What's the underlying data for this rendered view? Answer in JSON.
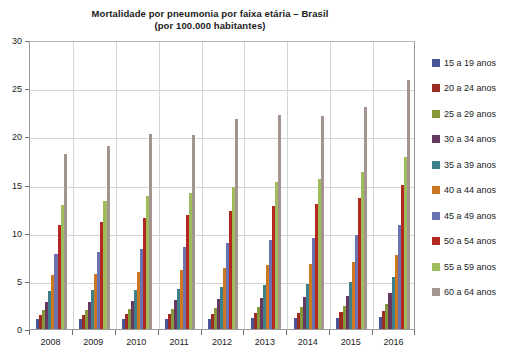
{
  "chart_data": {
    "type": "bar",
    "title": "Mortalidade por pneumonia por faixa etária – Brasil",
    "subtitle": "(por 100.000 habitantes)",
    "xlabel": "",
    "ylabel": "",
    "ylim": [
      0,
      30
    ],
    "ytick_step": 5,
    "yticks": [
      "0",
      "5",
      "10",
      "15",
      "20",
      "25",
      "30"
    ],
    "grid": true,
    "legend_position": "right",
    "categories": [
      "2008",
      "2009",
      "2010",
      "2011",
      "2012",
      "2013",
      "2014",
      "2015",
      "2016"
    ],
    "series": [
      {
        "name": "15 a 19 anos",
        "color": "#4a5599",
        "values": [
          1.0,
          1.0,
          1.0,
          1.0,
          1.0,
          1.1,
          1.1,
          1.1,
          1.2
        ]
      },
      {
        "name": "20 a 24 anos",
        "color": "#9c2b22",
        "values": [
          1.5,
          1.5,
          1.6,
          1.6,
          1.6,
          1.7,
          1.7,
          1.8,
          1.9
        ]
      },
      {
        "name": "25 a 29 anos",
        "color": "#87973b",
        "values": [
          2.0,
          2.0,
          2.1,
          2.1,
          2.2,
          2.3,
          2.3,
          2.4,
          2.6
        ]
      },
      {
        "name": "30 a 34 anos",
        "color": "#66385f",
        "values": [
          2.8,
          2.8,
          2.9,
          3.0,
          3.1,
          3.2,
          3.3,
          3.4,
          3.7
        ]
      },
      {
        "name": "35 a 39 anos",
        "color": "#3e7f8c",
        "values": [
          3.9,
          4.0,
          4.1,
          4.2,
          4.4,
          4.6,
          4.7,
          4.9,
          5.4
        ]
      },
      {
        "name": "40 a 44 anos",
        "color": "#cc7722",
        "values": [
          5.6,
          5.7,
          5.9,
          6.1,
          6.3,
          6.6,
          6.7,
          7.0,
          7.7
        ]
      },
      {
        "name": "45 a 49 anos",
        "color": "#6b74b2",
        "values": [
          7.8,
          8.0,
          8.3,
          8.5,
          8.9,
          9.2,
          9.4,
          9.8,
          10.8
        ]
      },
      {
        "name": "50 a 54 anos",
        "color": "#b3281f",
        "values": [
          10.8,
          11.1,
          11.5,
          11.8,
          12.3,
          12.8,
          13.0,
          13.6,
          14.9
        ]
      },
      {
        "name": "55 a 59 anos",
        "color": "#9fbc5c",
        "values": [
          12.9,
          13.3,
          13.8,
          14.1,
          14.7,
          15.3,
          15.6,
          16.3,
          17.9
        ]
      },
      {
        "name": "60 a 64 anos",
        "color": "#a39490",
        "values": [
          18.2,
          19.0,
          20.2,
          20.1,
          21.8,
          22.2,
          22.1,
          23.0,
          25.8
        ]
      }
    ]
  },
  "legend": {
    "items": [
      {
        "label": "15 a 19 anos"
      },
      {
        "label": "20 a 24 anos"
      },
      {
        "label": "25 a 29 anos"
      },
      {
        "label": "30 a 34 anos"
      },
      {
        "label": "35 a 39 anos"
      },
      {
        "label": "40 a 44 anos"
      },
      {
        "label": "45 a 49 anos"
      },
      {
        "label": "50 a 54 anos"
      },
      {
        "label": "55 a 59 anos"
      },
      {
        "label": "60 a 64 anos"
      }
    ]
  }
}
